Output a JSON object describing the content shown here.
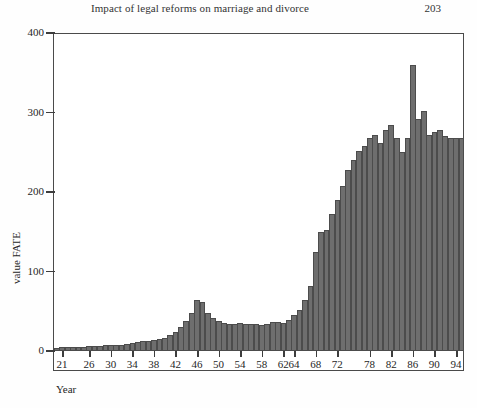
{
  "running_head": {
    "title": "Impact of legal reforms on marriage and divorce",
    "page_number": "203"
  },
  "figure": {
    "y_axis_title": "value FATE",
    "x_axis_title": "Year"
  },
  "chart_data": {
    "type": "bar",
    "title": "",
    "xlabel": "Year",
    "ylabel": "value FATE",
    "ylim": [
      0,
      400
    ],
    "yticks": [
      0,
      100,
      200,
      300,
      400
    ],
    "xticks": [
      "21",
      "26",
      "30",
      "34",
      "38",
      "42",
      "46",
      "50",
      "54",
      "58",
      "62",
      "64",
      "68",
      "72",
      "78",
      "82",
      "86",
      "90",
      "94"
    ],
    "grid": false,
    "legend": null,
    "categories": [
      "20",
      "21",
      "22",
      "23",
      "24",
      "25",
      "26",
      "27",
      "28",
      "29",
      "30",
      "31",
      "32",
      "33",
      "34",
      "35",
      "36",
      "37",
      "38",
      "39",
      "40",
      "41",
      "42",
      "43",
      "44",
      "45",
      "46",
      "47",
      "48",
      "49",
      "50",
      "51",
      "52",
      "53",
      "54",
      "55",
      "56",
      "57",
      "58",
      "59",
      "60",
      "61",
      "62",
      "63",
      "64",
      "65",
      "66",
      "67",
      "68",
      "69",
      "70",
      "71",
      "72",
      "73",
      "74",
      "75",
      "76",
      "77",
      "78",
      "79",
      "80",
      "81",
      "82",
      "83",
      "84",
      "85",
      "86",
      "87",
      "88",
      "89",
      "90",
      "91",
      "92",
      "93",
      "94",
      "95"
    ],
    "values": [
      4,
      5,
      5,
      5,
      5,
      5,
      6,
      6,
      6,
      7,
      8,
      8,
      8,
      9,
      10,
      11,
      12,
      13,
      14,
      15,
      17,
      20,
      24,
      30,
      38,
      48,
      64,
      62,
      48,
      41,
      38,
      35,
      34,
      34,
      35,
      34,
      34,
      34,
      33,
      34,
      36,
      37,
      35,
      39,
      45,
      52,
      64,
      82,
      125,
      150,
      152,
      172,
      190,
      208,
      228,
      240,
      252,
      258,
      268,
      272,
      262,
      278,
      284,
      268,
      250,
      268,
      360,
      292,
      302,
      272,
      276,
      278,
      270,
      268,
      268,
      268
    ]
  }
}
